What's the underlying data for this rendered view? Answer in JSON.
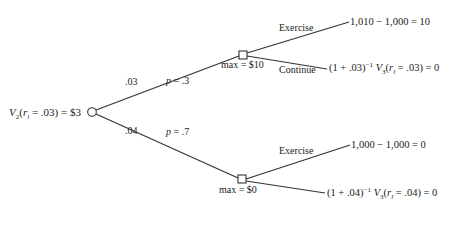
{
  "diagram": {
    "type": "decision-tree",
    "root": {
      "label_var": "V",
      "label_sub": "2",
      "label_arg_var": "r",
      "label_arg_sub": "l",
      "label_arg_rest": " = .03) = $3",
      "shape": "circle"
    },
    "branches": [
      {
        "rate_label": ".03",
        "prob_label_var": "p",
        "prob_label_rest": " = .3",
        "node_shape": "square",
        "node_label": "max = $10",
        "outcomes": [
          {
            "action": "Exercise",
            "value_text": "1,010 − 1,000 = 10"
          },
          {
            "action": "Continue",
            "value_prefix": "(1 + .03)",
            "value_exp": "−1",
            "value_var": " V",
            "value_sub": "3",
            "value_arg_var": "r",
            "value_arg_sub": "l",
            "value_rest": " = .03) = 0"
          }
        ]
      },
      {
        "rate_label": ".04",
        "prob_label_var": "p",
        "prob_label_rest": " = .7",
        "node_shape": "square",
        "node_label": "max = $0",
        "outcomes": [
          {
            "action": "Exercise",
            "value_text": "1,000 − 1,000 = 0"
          },
          {
            "action": "",
            "value_prefix": "(1 + .04)",
            "value_exp": "−1",
            "value_var": " V",
            "value_sub": "3",
            "value_arg_var": "r",
            "value_arg_sub": "l",
            "value_rest": " = .04) = 0"
          }
        ]
      }
    ],
    "colors": {
      "line": "#333333",
      "text": "#222222",
      "background": "#ffffff"
    }
  }
}
